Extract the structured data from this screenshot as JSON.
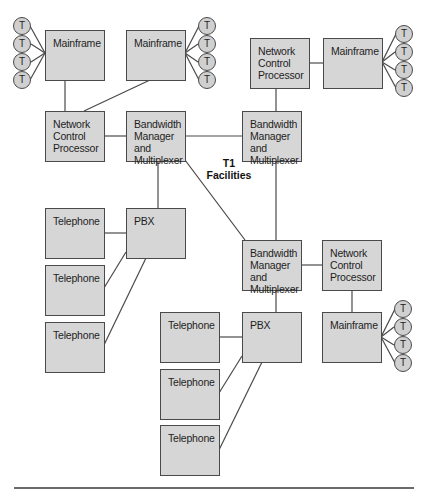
{
  "diagram": {
    "nodes": {
      "mainframe_tl": {
        "label": "Mainframe"
      },
      "mainframe_tm": {
        "label": "Mainframe"
      },
      "ncp_left": {
        "label": "Network\nControl\nProcessor"
      },
      "bmm_left": {
        "label": "Bandwidth\nManager and\nMultiplexer"
      },
      "ncp_tr": {
        "label": "Network\nControl\nProcessor"
      },
      "mainframe_tr": {
        "label": "Mainframe"
      },
      "bmm_right": {
        "label": "Bandwidth\nManager and\nMultiplexer"
      },
      "telephone_l1": {
        "label": "Telephone"
      },
      "telephone_l2": {
        "label": "Telephone"
      },
      "telephone_l3": {
        "label": "Telephone"
      },
      "pbx_left": {
        "label": "PBX"
      },
      "bmm_bottom": {
        "label": "Bandwidth\nManager and\nMultiplexer"
      },
      "ncp_bottom": {
        "label": "Network\nControl\nProcessor"
      },
      "pbx_bottom": {
        "label": "PBX"
      },
      "mainframe_br": {
        "label": "Mainframe"
      },
      "telephone_b1": {
        "label": "Telephone"
      },
      "telephone_b2": {
        "label": "Telephone"
      },
      "telephone_b3": {
        "label": "Telephone"
      }
    },
    "terminal_label": "T",
    "t1_label": "T1\nFacilities",
    "colors": {
      "box_fill": "#d6d6d6",
      "stroke": "#4a4a4a",
      "rule": "#6b6b6b"
    }
  }
}
